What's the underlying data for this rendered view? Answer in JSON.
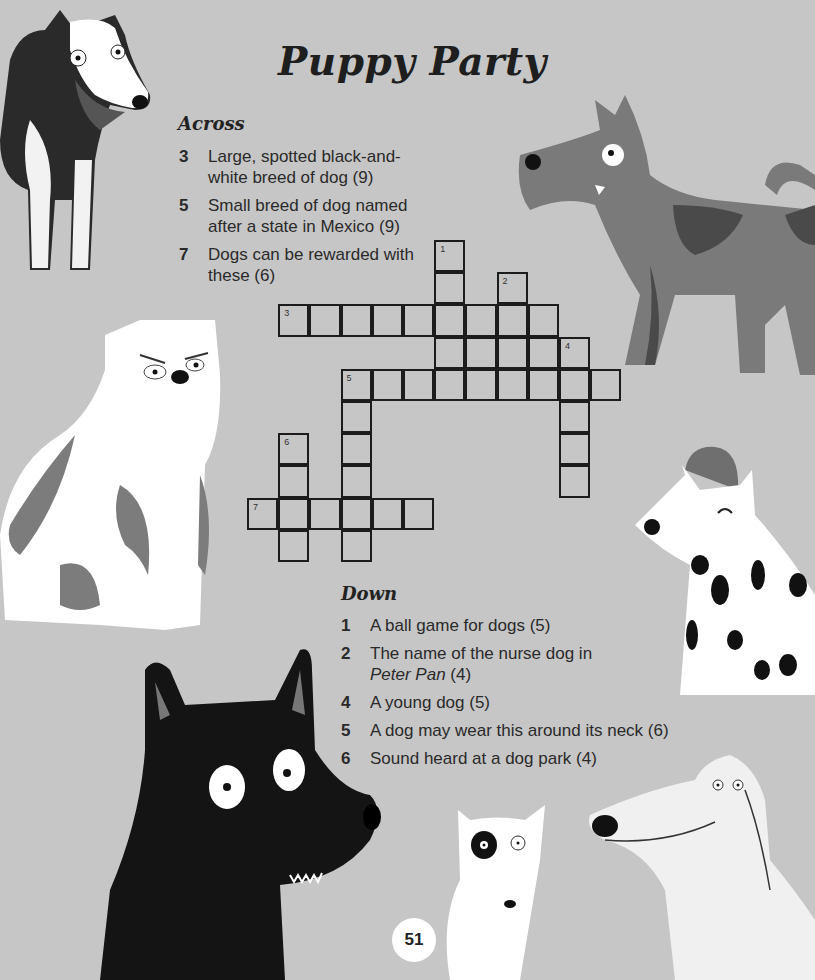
{
  "title": "Puppy Party",
  "page_number": "51",
  "colors": {
    "background": "#c6c6c6",
    "ink": "#1e1e1e",
    "grid_line": "#1c1c1c",
    "dog_white": "#ffffff",
    "dog_mid_gray": "#7a7a7a",
    "dog_dark_gray": "#4d4d4d",
    "dog_black": "#141414"
  },
  "across": {
    "heading": "Across",
    "clues": [
      {
        "num": "3",
        "text": "Large, spotted black-and-white breed of dog (9)"
      },
      {
        "num": "5",
        "text": "Small breed of dog named after a state in Mexico (9)"
      },
      {
        "num": "7",
        "text": "Dogs can be rewarded with these (6)"
      }
    ]
  },
  "down": {
    "heading": "Down",
    "clues": [
      {
        "num": "1",
        "text": "A ball game for dogs (5)"
      },
      {
        "num": "2",
        "text_prefix": "The name of the nurse dog in ",
        "text_italic": "Peter Pan",
        "text_suffix": " (4)"
      },
      {
        "num": "4",
        "text": "A young dog (5)"
      },
      {
        "num": "5",
        "text": "A dog may wear this around its neck (6)"
      },
      {
        "num": "6",
        "text": "Sound heard at a dog park (4)"
      }
    ]
  },
  "grid": {
    "cell_w": 31.2,
    "cell_h": 32.2,
    "cells": [
      {
        "r": 0,
        "c": 6,
        "n": "1"
      },
      {
        "r": 1,
        "c": 6
      },
      {
        "r": 1,
        "c": 8,
        "n": "2"
      },
      {
        "r": 2,
        "c": 1,
        "n": "3"
      },
      {
        "r": 2,
        "c": 2
      },
      {
        "r": 2,
        "c": 3
      },
      {
        "r": 2,
        "c": 4
      },
      {
        "r": 2,
        "c": 5
      },
      {
        "r": 2,
        "c": 6
      },
      {
        "r": 2,
        "c": 7
      },
      {
        "r": 2,
        "c": 8
      },
      {
        "r": 2,
        "c": 9
      },
      {
        "r": 3,
        "c": 6
      },
      {
        "r": 3,
        "c": 7
      },
      {
        "r": 3,
        "c": 8
      },
      {
        "r": 3,
        "c": 9
      },
      {
        "r": 3,
        "c": 10,
        "n": "4"
      },
      {
        "r": 4,
        "c": 3,
        "n": "5"
      },
      {
        "r": 4,
        "c": 4
      },
      {
        "r": 4,
        "c": 5
      },
      {
        "r": 4,
        "c": 6
      },
      {
        "r": 4,
        "c": 7
      },
      {
        "r": 4,
        "c": 8
      },
      {
        "r": 4,
        "c": 9
      },
      {
        "r": 4,
        "c": 10
      },
      {
        "r": 4,
        "c": 11
      },
      {
        "r": 5,
        "c": 3
      },
      {
        "r": 5,
        "c": 10
      },
      {
        "r": 6,
        "c": 1,
        "n": "6"
      },
      {
        "r": 6,
        "c": 3
      },
      {
        "r": 6,
        "c": 10
      },
      {
        "r": 7,
        "c": 1
      },
      {
        "r": 7,
        "c": 3
      },
      {
        "r": 7,
        "c": 10
      },
      {
        "r": 8,
        "c": 0,
        "n": "7"
      },
      {
        "r": 8,
        "c": 1
      },
      {
        "r": 8,
        "c": 2
      },
      {
        "r": 8,
        "c": 3
      },
      {
        "r": 8,
        "c": 4
      },
      {
        "r": 8,
        "c": 5
      },
      {
        "r": 9,
        "c": 1
      },
      {
        "r": 9,
        "c": 3
      }
    ]
  },
  "illustrations": [
    {
      "name": "collie-dog",
      "desc": "black-and-white rough collie, top left"
    },
    {
      "name": "terrier-dog",
      "desc": "gray terrier with dark spots, top right"
    },
    {
      "name": "bulldog",
      "desc": "white bulldog with gray patches, left middle"
    },
    {
      "name": "dalmatian-dog",
      "desc": "dalmatian wearing gray beanie, right middle"
    },
    {
      "name": "black-dog",
      "desc": "black dog with white eyes, bottom left"
    },
    {
      "name": "bull-terrier-dog",
      "desc": "white bull terrier with eye patch, bottom center"
    },
    {
      "name": "hound-dog",
      "desc": "white long-snouted hound, bottom right"
    }
  ]
}
